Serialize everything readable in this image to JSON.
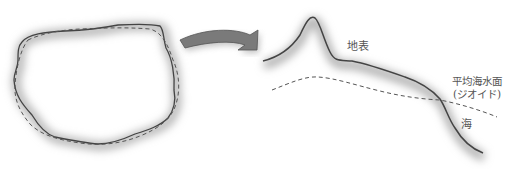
{
  "diagram": {
    "left_figure": {
      "name": "earth-cross-section",
      "solid_outline": "irregular earth shape",
      "dashed_outline": "geoid approximation"
    },
    "arrow": {
      "direction": "right",
      "color": "#777777"
    },
    "right_figure": {
      "labels": {
        "surface": "地表",
        "geoid_line1": "平均海水面",
        "geoid_line2": "(ジオイド)",
        "sea": "海"
      }
    },
    "colors": {
      "line": "#444444",
      "shadow": "#bbbbbb",
      "dash": "#555555",
      "text": "#555555"
    }
  }
}
